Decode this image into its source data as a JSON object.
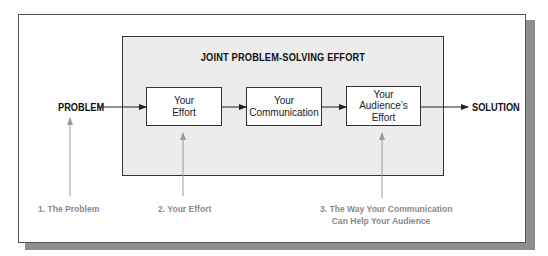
{
  "diagram": {
    "panel_title": "JOINT PROBLEM-SOLVING EFFORT",
    "input_label": "PROBLEM",
    "output_label": "SOLUTION",
    "boxes": [
      {
        "lines": [
          "Your",
          "Effort"
        ]
      },
      {
        "lines": [
          "Your",
          "Communication"
        ]
      },
      {
        "lines": [
          "Your",
          "Audience’s",
          "Effort"
        ]
      }
    ],
    "notes": [
      {
        "lines": [
          "1.  The Problem"
        ]
      },
      {
        "lines": [
          "2.  Your Effort"
        ]
      },
      {
        "lines": [
          "3.  The Way Your Communication",
          "Can Help Your Audience"
        ]
      }
    ],
    "colors": {
      "panel_fill": "#ececec",
      "shadow": "#8e8e8e",
      "note_text": "#8a8a8a",
      "pointer_arrow": "#9a9a9a",
      "flow_arrow": "#222222"
    }
  }
}
